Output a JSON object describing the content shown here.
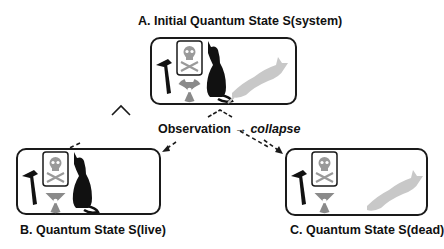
{
  "diagram": {
    "state_a": {
      "title": "A. Initial Quantum State S(system)",
      "contents": [
        "hammer-icon",
        "poison-skull-icon",
        "radiation-icon",
        "live-cat-icon",
        "dead-cat-icon"
      ]
    },
    "state_b": {
      "title": "B. Quantum State S(live)",
      "contents": [
        "hammer-icon",
        "poison-skull-icon",
        "radiation-icon",
        "live-cat-icon"
      ]
    },
    "state_c": {
      "title": "C. Quantum State S(dead)",
      "contents": [
        "hammer-icon",
        "poison-skull-icon",
        "radiation-icon",
        "dead-cat-icon"
      ]
    },
    "transition": {
      "label": "Observation",
      "arrow": "→",
      "result": "collapse"
    },
    "colors": {
      "live_cat": "#111111",
      "dead_cat": "#c8c8c8",
      "skull": "#9a9a9a",
      "radiation": "#8a8a8a",
      "border": "#1a1a1a"
    }
  }
}
